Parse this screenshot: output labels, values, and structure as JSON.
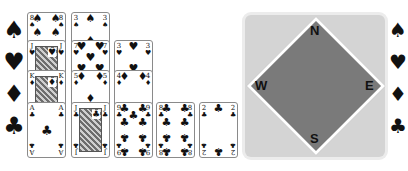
{
  "suit_legend_left": [
    "♠",
    "♥",
    "♦",
    "♣"
  ],
  "suit_legend_right": [
    "♠",
    "♥",
    "♦",
    "♣"
  ],
  "tableau": [
    {
      "column": 1,
      "cards": [
        {
          "rank": "8",
          "suit": "♠",
          "top": 12
        },
        {
          "rank": "J",
          "suit": "♥",
          "top": 40,
          "face": true
        },
        {
          "rank": "K",
          "suit": "♦",
          "top": 70,
          "face": true
        },
        {
          "rank": "A",
          "suit": "♣",
          "top": 102
        }
      ]
    },
    {
      "column": 2,
      "cards": [
        {
          "rank": "3",
          "suit": "♠",
          "top": 12
        },
        {
          "rank": "7",
          "suit": "♥",
          "top": 40
        },
        {
          "rank": "5",
          "suit": "♦",
          "top": 70
        },
        {
          "rank": "J",
          "suit": "♣",
          "top": 102,
          "face": true
        }
      ]
    },
    {
      "column": 3,
      "cards": [
        {
          "rank": "3",
          "suit": "♥",
          "top": 40
        },
        {
          "rank": "4",
          "suit": "♦",
          "top": 70
        },
        {
          "rank": "9",
          "suit": "♣",
          "top": 102
        }
      ]
    },
    {
      "column": 4,
      "cards": [
        {
          "rank": "8",
          "suit": "♣",
          "top": 102
        }
      ]
    },
    {
      "column": 5,
      "cards": [
        {
          "rank": "2",
          "suit": "♣",
          "top": 102
        }
      ]
    }
  ],
  "table": {
    "north": "N",
    "south": "S",
    "east": "E",
    "west": "W",
    "colors": {
      "panel": "#d4d4d4",
      "diamond": "#7a7a7a",
      "border": "#ffffff"
    }
  }
}
